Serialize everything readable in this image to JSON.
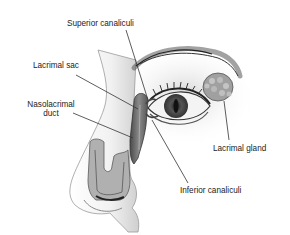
{
  "diagram": {
    "labels": {
      "superior_canaliculi": "Superior canaliculi",
      "lacrimal_sac": "Lacrimal sac",
      "nasolacrimal_duct_line1": "Nasolacrimal",
      "nasolacrimal_duct_line2": "duct",
      "lacrimal_gland": "Lacrimal gland",
      "inferior_canaliculi": "Inferior canaliculi"
    },
    "colors": {
      "background": "#ffffff",
      "text": "#222222",
      "leader_line": "#333333",
      "skin_shade": "#bdbdbd",
      "duct_fill": "#6e6e6e",
      "gland_fill": "#9a9a9a"
    }
  }
}
